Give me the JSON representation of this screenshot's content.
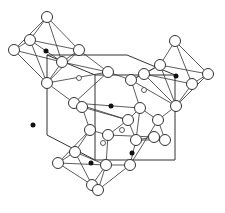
{
  "diagram": {
    "type": "crystal-structure-polyhedra",
    "colors": {
      "line": "#333333",
      "atom_fill": "#ffffff",
      "dot": "#111111",
      "background": "#ffffff"
    },
    "unit_cell": [
      [
        95,
        75
      ],
      [
        175,
        75
      ],
      [
        175,
        160
      ],
      [
        95,
        160
      ],
      [
        47,
        135
      ],
      [
        47,
        55
      ],
      [
        127,
        55
      ]
    ],
    "atoms": [
      [
        47,
        17
      ],
      [
        14,
        50
      ],
      [
        30,
        40
      ],
      [
        79,
        50
      ],
      [
        62,
        62
      ],
      [
        47,
        83
      ],
      [
        108,
        72
      ],
      [
        175,
        41
      ],
      [
        160,
        65
      ],
      [
        144,
        74
      ],
      [
        208,
        74
      ],
      [
        192,
        84
      ],
      [
        176,
        106
      ],
      [
        131,
        80
      ],
      [
        74,
        103
      ],
      [
        82,
        107
      ],
      [
        140,
        108
      ],
      [
        128,
        120
      ],
      [
        108,
        135
      ],
      [
        90,
        130
      ],
      [
        75,
        152
      ],
      [
        58,
        163
      ],
      [
        106,
        165
      ],
      [
        136,
        140
      ],
      [
        154,
        137
      ],
      [
        92,
        185
      ],
      [
        130,
        165
      ],
      [
        98,
        190
      ],
      [
        158,
        120
      ],
      [
        165,
        140
      ]
    ],
    "dots": [
      [
        46,
        51
      ],
      [
        176,
        76
      ],
      [
        111,
        106
      ],
      [
        33,
        125
      ],
      [
        91,
        163
      ],
      [
        132,
        153
      ]
    ],
    "small_rings": [
      [
        79,
        78
      ],
      [
        144,
        90
      ],
      [
        103,
        143
      ],
      [
        122,
        130
      ]
    ],
    "bonds": [
      [
        0,
        1
      ],
      [
        0,
        2
      ],
      [
        0,
        3
      ],
      [
        0,
        4
      ],
      [
        1,
        2
      ],
      [
        1,
        4
      ],
      [
        1,
        5
      ],
      [
        2,
        3
      ],
      [
        2,
        4
      ],
      [
        3,
        4
      ],
      [
        3,
        5
      ],
      [
        4,
        5
      ],
      [
        3,
        6
      ],
      [
        4,
        6
      ],
      [
        5,
        6
      ],
      [
        2,
        5
      ],
      [
        7,
        8
      ],
      [
        7,
        10
      ],
      [
        7,
        11
      ],
      [
        8,
        9
      ],
      [
        8,
        10
      ],
      [
        8,
        12
      ],
      [
        9,
        11
      ],
      [
        9,
        12
      ],
      [
        10,
        11
      ],
      [
        10,
        12
      ],
      [
        11,
        12
      ],
      [
        9,
        13
      ],
      [
        13,
        8
      ],
      [
        13,
        12
      ],
      [
        14,
        15
      ],
      [
        14,
        16
      ],
      [
        14,
        17
      ],
      [
        15,
        17
      ],
      [
        15,
        19
      ],
      [
        16,
        17
      ],
      [
        16,
        23
      ],
      [
        17,
        18
      ],
      [
        17,
        23
      ],
      [
        18,
        19
      ],
      [
        18,
        22
      ],
      [
        19,
        20
      ],
      [
        19,
        21
      ],
      [
        20,
        21
      ],
      [
        20,
        22
      ],
      [
        21,
        22
      ],
      [
        21,
        25
      ],
      [
        22,
        25
      ],
      [
        20,
        25
      ],
      [
        18,
        24
      ],
      [
        23,
        24
      ],
      [
        24,
        29
      ],
      [
        23,
        29
      ],
      [
        23,
        26
      ],
      [
        26,
        28
      ],
      [
        28,
        29
      ],
      [
        22,
        26
      ],
      [
        26,
        27
      ],
      [
        27,
        22
      ],
      [
        16,
        28
      ],
      [
        13,
        16
      ],
      [
        6,
        14
      ],
      [
        6,
        13
      ],
      [
        5,
        14
      ],
      [
        12,
        28
      ]
    ]
  }
}
